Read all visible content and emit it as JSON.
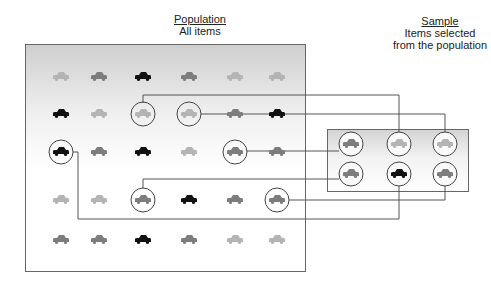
{
  "population": {
    "heading": "Population",
    "subtitle": "All items",
    "columns_x": [
      61,
      99,
      143,
      189,
      235,
      277
    ],
    "rows_y": [
      77,
      114,
      152,
      200,
      240
    ],
    "grid": [
      [
        "light",
        "mid",
        "black",
        "mid",
        "light",
        "light"
      ],
      [
        "black",
        "light",
        "light",
        "light",
        "mid",
        "black"
      ],
      [
        "black",
        "mid",
        "black",
        "light",
        "mid",
        "mid"
      ],
      [
        "light",
        "light",
        "mid",
        "black",
        "mid",
        "mid"
      ],
      [
        "mid",
        "mid",
        "black",
        "mid",
        "light",
        "light"
      ]
    ],
    "selected": [
      [
        1,
        2
      ],
      [
        1,
        3
      ],
      [
        2,
        0
      ],
      [
        2,
        4
      ],
      [
        3,
        2
      ],
      [
        3,
        5
      ]
    ]
  },
  "sample": {
    "heading": "Sample",
    "subtitle_line1": "Items selected",
    "subtitle_line2": "from the population",
    "columns_x": [
      351,
      399,
      445
    ],
    "rows_y": [
      144,
      174
    ],
    "grid": [
      [
        "mid",
        "light",
        "light"
      ],
      [
        "mid",
        "black",
        "mid"
      ]
    ]
  },
  "colors": {
    "light": "#b4b4b4",
    "mid": "#7d7d7d",
    "black": "#111111",
    "line": "#555555"
  },
  "connections": [
    {
      "from": [
        143,
        114
      ],
      "path": "M143,103 L143,95 L399,95 L399,132"
    },
    {
      "from": [
        189,
        114
      ],
      "path": "M201,114 L445,114 L445,132"
    },
    {
      "from": [
        235,
        152
      ],
      "path": "M247,151 L339,151"
    },
    {
      "from": [
        143,
        200
      ],
      "path": "M143,188 L143,179 L339,179"
    },
    {
      "from": [
        277,
        200
      ],
      "path": "M289,200 L445,200 L445,186"
    },
    {
      "from": [
        61,
        152
      ],
      "path": "M73,152 L78,152 L78,219 L399,219 L399,186"
    }
  ]
}
